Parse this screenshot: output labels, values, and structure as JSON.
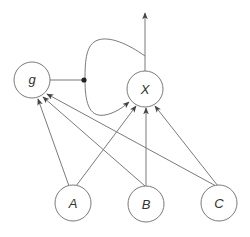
{
  "diagram": {
    "type": "causal-graph",
    "colors": {
      "stroke": "#7a7a7a",
      "text": "#333333",
      "dot": "#222222",
      "background": "#ffffff"
    },
    "nodes": [
      {
        "id": "g",
        "label": "g",
        "cx": 32,
        "cy": 80,
        "r": 18
      },
      {
        "id": "X",
        "label": "X",
        "cx": 145,
        "cy": 89,
        "r": 18
      },
      {
        "id": "A",
        "label": "A",
        "cx": 73,
        "cy": 203,
        "r": 18
      },
      {
        "id": "B",
        "label": "B",
        "cx": 146,
        "cy": 204,
        "r": 18
      },
      {
        "id": "C",
        "label": "C",
        "cx": 219,
        "cy": 203,
        "r": 18
      }
    ],
    "edges": [
      {
        "from": "A",
        "to": "g"
      },
      {
        "from": "B",
        "to": "g"
      },
      {
        "from": "C",
        "to": "g"
      },
      {
        "from": "A",
        "to": "X"
      },
      {
        "from": "B",
        "to": "X"
      },
      {
        "from": "C",
        "to": "X"
      },
      {
        "from": "X",
        "to": "output",
        "direction": "up"
      },
      {
        "from": "X",
        "to": "X",
        "type": "feedback-loop"
      },
      {
        "from": "g",
        "to": "feedback-loop",
        "type": "modulator",
        "marker": "dot"
      }
    ]
  }
}
